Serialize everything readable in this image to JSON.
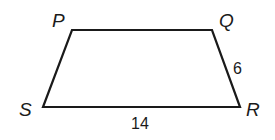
{
  "diagram": {
    "type": "quadrilateral",
    "shape": "trapezoid",
    "stroke_color": "#1a1a1a",
    "vertices": {
      "P": {
        "label": "P",
        "x": 72,
        "y": 30
      },
      "Q": {
        "label": "Q",
        "x": 212,
        "y": 30
      },
      "R": {
        "label": "R",
        "x": 240,
        "y": 107
      },
      "S": {
        "label": "S",
        "x": 43,
        "y": 107
      }
    },
    "side_labels": {
      "QR": "6",
      "SR": "14"
    }
  }
}
